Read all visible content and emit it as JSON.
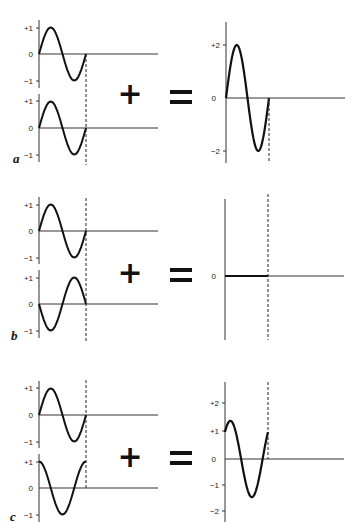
{
  "figure": {
    "operators": {
      "plus": "+",
      "equals": "="
    },
    "panels": [
      {
        "label": "a",
        "description": "In-phase waves add constructively",
        "input_waves": [
          {
            "amplitude": 1,
            "phase_deg": 0,
            "ticks": [
              "+1",
              "0",
              "−1"
            ]
          },
          {
            "amplitude": 1,
            "phase_deg": 0,
            "ticks": [
              "+1",
              "0",
              "−1"
            ]
          }
        ],
        "result": {
          "amplitude": 2,
          "phase_deg": 0,
          "ticks": [
            "+2",
            "0",
            "−2"
          ]
        }
      },
      {
        "label": "b",
        "description": "Out-of-phase waves cancel",
        "input_waves": [
          {
            "amplitude": 1,
            "phase_deg": 0,
            "ticks": [
              "+1",
              "0",
              "−1"
            ]
          },
          {
            "amplitude": 1,
            "phase_deg": 180,
            "ticks": [
              "+1",
              "0",
              "−1"
            ]
          }
        ],
        "result": {
          "amplitude": 0,
          "phase_deg": 0,
          "ticks": [
            "0"
          ]
        }
      },
      {
        "label": "c",
        "description": "Waves 90 degrees out of phase partially add",
        "input_waves": [
          {
            "amplitude": 1,
            "phase_deg": 0,
            "ticks": [
              "+1",
              "0",
              "−1"
            ]
          },
          {
            "amplitude": 1,
            "phase_deg": 90,
            "ticks": [
              "+1",
              "0",
              "−1"
            ]
          }
        ],
        "result": {
          "amplitude": 1.414,
          "phase_deg": 45,
          "ticks": [
            "+2",
            "+1",
            "0",
            "−1",
            "−2"
          ]
        }
      }
    ]
  },
  "chart_data": [
    {
      "type": "line",
      "panel": "a",
      "title": "a",
      "x": "one full period (0 to 360 deg)",
      "series": [
        {
          "name": "wave 1",
          "function": "sin(x)",
          "amplitude": 1
        },
        {
          "name": "wave 2",
          "function": "sin(x)",
          "amplitude": 1
        },
        {
          "name": "sum",
          "function": "2 sin(x)",
          "amplitude": 2
        }
      ],
      "ylim_inputs": [
        -1,
        1
      ],
      "ylim_result": [
        -2,
        2
      ],
      "input_ticks": [
        "+1",
        "0",
        "-1"
      ],
      "result_ticks": [
        "+2",
        "0",
        "-2"
      ]
    },
    {
      "type": "line",
      "panel": "b",
      "title": "b",
      "series": [
        {
          "name": "wave 1",
          "function": "sin(x)",
          "amplitude": 1
        },
        {
          "name": "wave 2",
          "function": "-sin(x)",
          "amplitude": 1
        },
        {
          "name": "sum",
          "function": "0",
          "amplitude": 0
        }
      ],
      "ylim_inputs": [
        -1,
        1
      ],
      "input_ticks": [
        "+1",
        "0",
        "-1"
      ],
      "result_ticks": [
        "0"
      ]
    },
    {
      "type": "line",
      "panel": "c",
      "title": "c",
      "series": [
        {
          "name": "wave 1",
          "function": "sin(x)",
          "amplitude": 1
        },
        {
          "name": "wave 2",
          "function": "cos(x)",
          "amplitude": 1
        },
        {
          "name": "sum",
          "function": "sin(x)+cos(x)",
          "amplitude": 1.414
        }
      ],
      "ylim_inputs": [
        -1,
        1
      ],
      "ylim_result": [
        -2,
        2
      ],
      "input_ticks": [
        "+1",
        "0",
        "-1"
      ],
      "result_ticks": [
        "+2",
        "+1",
        "0",
        "-1",
        "-2"
      ]
    }
  ],
  "layout": {
    "ink": "#111111",
    "axis": "#333333"
  }
}
